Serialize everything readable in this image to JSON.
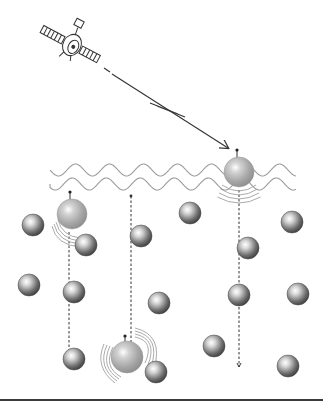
{
  "diagram": {
    "title": "Satellite signal received by ocean surface with particles sinking through water column",
    "colors": {
      "background": "#ffffff",
      "line": "#333333",
      "wave": "#9a9a9a",
      "large_sphere": "#a8a8a8",
      "small_sphere": "#6a6a6a",
      "rule": "#3a3a3a"
    },
    "satellite": {
      "x": 72,
      "y": 45,
      "icon": "satellite-icon"
    },
    "signal_arrow": {
      "x1": 112,
      "y1": 74,
      "x2": 228,
      "y2": 148
    },
    "signal_bolt": {
      "points": "150,103 178,114 157,106 185,117"
    },
    "surface_waves": [
      {
        "y": 170,
        "x_start": 50,
        "x_end": 296,
        "amplitude": 6,
        "wavelength": 34
      },
      {
        "y": 184,
        "x_start": 50,
        "x_end": 296,
        "amplitude": 6,
        "wavelength": 34
      }
    ],
    "large_spheres": [
      {
        "cx": 239,
        "cy": 172,
        "r": 15,
        "drop_line": {
          "x": 239,
          "y1": 190,
          "y2": 367
        },
        "marker_y": 150
      },
      {
        "cx": 72,
        "cy": 214,
        "r": 15,
        "drop_line": {
          "x": 69,
          "y1": 232,
          "y2": 356
        },
        "marker_y": 192
      },
      {
        "cx": 127,
        "cy": 357,
        "r": 16,
        "drop_line": null,
        "marker_y": 336
      }
    ],
    "rising_line": {
      "x": 131,
      "y1": 196,
      "y2": 342
    },
    "small_spheres": [
      {
        "cx": 33,
        "cy": 225,
        "r": 11
      },
      {
        "cx": 86,
        "cy": 245,
        "r": 11
      },
      {
        "cx": 141,
        "cy": 236,
        "r": 11
      },
      {
        "cx": 190,
        "cy": 213,
        "r": 11
      },
      {
        "cx": 292,
        "cy": 222,
        "r": 11
      },
      {
        "cx": 248,
        "cy": 248,
        "r": 11
      },
      {
        "cx": 29,
        "cy": 285,
        "r": 11
      },
      {
        "cx": 74,
        "cy": 292,
        "r": 11
      },
      {
        "cx": 159,
        "cy": 303,
        "r": 11
      },
      {
        "cx": 239,
        "cy": 295,
        "r": 11
      },
      {
        "cx": 298,
        "cy": 294,
        "r": 11
      },
      {
        "cx": 74,
        "cy": 359,
        "r": 11
      },
      {
        "cx": 156,
        "cy": 372,
        "r": 11
      },
      {
        "cx": 214,
        "cy": 346,
        "r": 11
      },
      {
        "cx": 288,
        "cy": 366,
        "r": 11
      }
    ],
    "bottom_rule": {
      "y": 400
    }
  }
}
